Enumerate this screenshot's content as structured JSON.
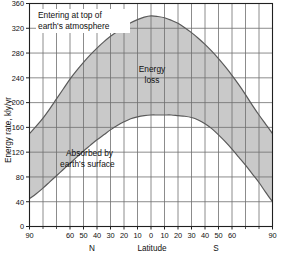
{
  "chart_data": {
    "type": "area",
    "title": "",
    "subtitle": "",
    "xlabel": "Latitude",
    "ylabel": "Energy rate, kly/yr",
    "xlim": [
      -90,
      90
    ],
    "ylim": [
      0,
      360
    ],
    "grid": true,
    "legend_position": "none",
    "x_tick_labels": [
      "90",
      "60",
      "50",
      "40",
      "30",
      "20",
      "10",
      "0",
      "10",
      "20",
      "30",
      "40",
      "50",
      "60",
      "90"
    ],
    "x_tick_values": [
      -90,
      -60,
      -50,
      -40,
      -30,
      -20,
      -10,
      0,
      10,
      20,
      30,
      40,
      50,
      60,
      90
    ],
    "x_minor_ticks": [
      -80,
      -70,
      70,
      80
    ],
    "y_tick_labels": [
      "0",
      "40",
      "80",
      "120",
      "160",
      "200",
      "240",
      "280",
      "320",
      "360"
    ],
    "y_tick_values": [
      0,
      40,
      80,
      120,
      160,
      200,
      240,
      280,
      320,
      360
    ],
    "hemisphere_left": "N",
    "hemisphere_right": "S",
    "x": [
      -90,
      -85,
      -80,
      -75,
      -70,
      -65,
      -60,
      -55,
      -50,
      -45,
      -40,
      -35,
      -30,
      -25,
      -20,
      -15,
      -10,
      -5,
      0,
      5,
      10,
      15,
      20,
      25,
      30,
      35,
      40,
      45,
      50,
      55,
      60,
      65,
      70,
      75,
      80,
      85,
      90
    ],
    "series": [
      {
        "name": "Entering at top of earth's atmosphere",
        "label_line1": "Entering at top of",
        "label_line2": "earth's atmosphere",
        "values": [
          150,
          162,
          175,
          190,
          206,
          222,
          238,
          252,
          265,
          277,
          288,
          298,
          307,
          315,
          322,
          329,
          334,
          338,
          340,
          339,
          337,
          333,
          328,
          321,
          313,
          304,
          294,
          283,
          271,
          258,
          244,
          229,
          213,
          196,
          180,
          165,
          150
        ]
      },
      {
        "name": "Absorbed by earth's surface",
        "label_line1": "Absorbed by",
        "label_line2": "earth's surface",
        "values": [
          45,
          53,
          62,
          72,
          82,
          92,
          102,
          112,
          122,
          131,
          140,
          148,
          156,
          163,
          169,
          174,
          177,
          179,
          180,
          180,
          180,
          180,
          179,
          178,
          176,
          172,
          166,
          158,
          148,
          137,
          125,
          112,
          99,
          85,
          71,
          55,
          40
        ]
      }
    ],
    "fill_label_line1": "Energy",
    "fill_label_line2": "loss",
    "fill_color": "#c9c9c9",
    "curve_color": "#5a5a5a",
    "grid_color": "#6e6e6e",
    "axis_color": "#202020",
    "background": "#ffffff"
  }
}
